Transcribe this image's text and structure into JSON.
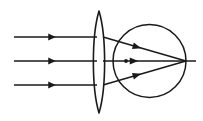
{
  "figure": {
    "name": "converging-lens-eye-ray-diagram",
    "background_color": "#ffffff",
    "stroke_color": "#1a1a1a",
    "canvas": {
      "width": 203,
      "height": 121
    }
  },
  "geometry": {
    "incoming_rays": [
      {
        "id": "ray-top",
        "x1": 14,
        "y1": 37,
        "x2": 96,
        "y2": 37,
        "arrow_x": 52,
        "arrow_y": 37
      },
      {
        "id": "ray-middle",
        "x1": 14,
        "y1": 61,
        "x2": 96,
        "y2": 61,
        "arrow_x": 52,
        "arrow_y": 61
      },
      {
        "id": "ray-bottom",
        "x1": 14,
        "y1": 85,
        "x2": 96,
        "y2": 85,
        "arrow_x": 52,
        "arrow_y": 85
      }
    ],
    "lens": {
      "center_x": 99,
      "top_y": 11,
      "bottom_y": 113,
      "half_width": 7.5,
      "type": "biconvex-converging"
    },
    "eye_circle": {
      "center_x": 149.5,
      "center_y": 61,
      "radius": 36.5
    },
    "focal_point": {
      "x": 186,
      "y": 61
    },
    "axis_extension": {
      "x1": 186,
      "y1": 61,
      "x2": 196,
      "y2": 61
    },
    "refracted_rays": [
      {
        "id": "refracted-top",
        "x1": 103,
        "y1": 37,
        "x2": 186,
        "y2": 61,
        "arrow_x": 137,
        "arrow_y": 47
      },
      {
        "id": "refracted-middle",
        "x1": 103,
        "y1": 61,
        "x2": 186,
        "y2": 61,
        "arrow_x": 134,
        "arrow_y": 61
      },
      {
        "id": "refracted-bottom",
        "x1": 103,
        "y1": 85,
        "x2": 186,
        "y2": 61,
        "arrow_x": 137,
        "arrow_y": 75
      }
    ],
    "axis_dot": {
      "x": 126,
      "y": 61,
      "r": 1.9
    }
  }
}
